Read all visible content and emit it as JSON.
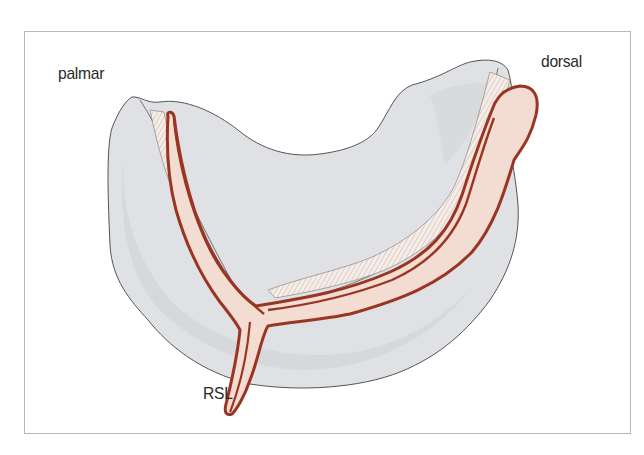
{
  "figure": {
    "type": "anatomical-illustration",
    "labels": {
      "palmar": "palmar",
      "dorsal": "dorsal",
      "rsl": "RSL"
    },
    "colors": {
      "bone_fill": "#dfe1e4",
      "bone_shadow": "#cfd2d6",
      "bone_outline": "#5a5a5a",
      "ligament_outline": "#9b3523",
      "ligament_fill": "#f3dcd2",
      "cartilage_fill": "#f7ece6",
      "hatch": "#7a7a7a",
      "frame_border": "#b8b8b8"
    }
  }
}
